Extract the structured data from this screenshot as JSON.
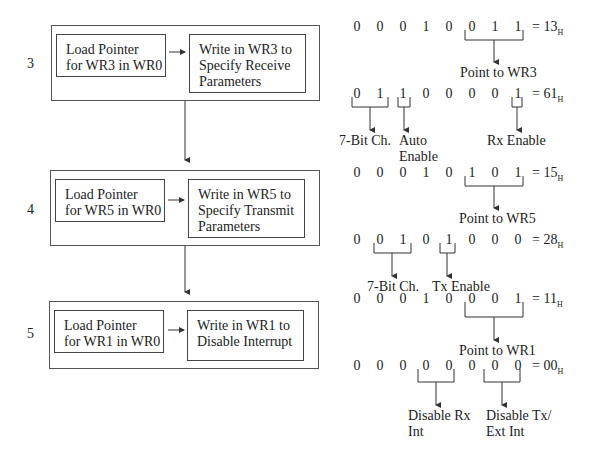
{
  "steps": [
    {
      "number": "3",
      "load_box": [
        "Load Pointer",
        "for WR3 in WR0"
      ],
      "write_box": [
        "Write in WR3 to",
        "Specify Receive",
        "Parameters"
      ]
    },
    {
      "number": "4",
      "load_box": [
        "Load Pointer",
        "for WR5 in WR0"
      ],
      "write_box": [
        "Write in WR5 to",
        "Specify Transmit",
        "Parameters"
      ]
    },
    {
      "number": "5",
      "load_box": [
        "Load Pointer",
        "for WR1 in WR0"
      ],
      "write_box": [
        "Write in WR1 to",
        "Disable Interrupt"
      ]
    }
  ],
  "bit_rows": [
    {
      "bits": [
        "0",
        "0",
        "0",
        "1",
        "0",
        "0",
        "1",
        "1"
      ],
      "value": "= 13",
      "suffix": "H",
      "labels": [
        "Point to WR3"
      ]
    },
    {
      "bits": [
        "0",
        "1",
        "1",
        "0",
        "0",
        "0",
        "0",
        "1"
      ],
      "value": "= 61",
      "suffix": "H",
      "labels": [
        "7-Bit Ch.",
        "Auto",
        "Enable",
        "Rx Enable"
      ]
    },
    {
      "bits": [
        "0",
        "0",
        "0",
        "1",
        "0",
        "1",
        "0",
        "1"
      ],
      "value": "= 15",
      "suffix": "H",
      "labels": [
        "Point to WR5"
      ]
    },
    {
      "bits": [
        "0",
        "0",
        "1",
        "0",
        "1",
        "0",
        "0",
        "0"
      ],
      "value": "= 28",
      "suffix": "H",
      "labels": [
        "7-Bit Ch.",
        "Tx Enable"
      ]
    },
    {
      "bits": [
        "0",
        "0",
        "0",
        "1",
        "0",
        "0",
        "0",
        "1"
      ],
      "value": "= 11",
      "suffix": "H",
      "labels": [
        "Point to WR1"
      ]
    },
    {
      "bits": [
        "0",
        "0",
        "0",
        "0",
        "0",
        "0",
        "0",
        "0"
      ],
      "value": "= 00",
      "suffix": "H",
      "labels": [
        "Disable Rx",
        "Int",
        "Disable Tx/",
        "Ext Int"
      ]
    }
  ]
}
